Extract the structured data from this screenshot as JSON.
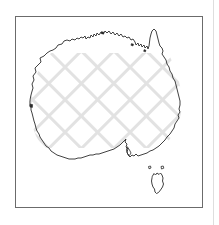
{
  "figure": {
    "title": "Australia",
    "caption": "",
    "frame": {
      "x": 15,
      "y": 16,
      "width": 188,
      "height": 192,
      "border_color": "#6b6b6b",
      "border_width": 1,
      "background_color": "#ffffff"
    },
    "page_background_color": "#ffffff",
    "page_edge_rule": {
      "x": 213,
      "color": "#dedede",
      "width": 1
    }
  },
  "map": {
    "region_name": "Australia",
    "outline_color": "#2b2b2b",
    "outline_width": 0.9,
    "fill_color": "#ffffff",
    "hatch": {
      "pattern": "diagonal-crosshatch",
      "color": "#e2e2e2",
      "angle_degrees": 45,
      "spacing": 23,
      "stroke_width": 6,
      "extent": {
        "x1": 29,
        "y1": 54,
        "x2": 182,
        "y2": 147
      }
    },
    "landmasses": [
      {
        "name": "mainland-australia"
      },
      {
        "name": "tasmania"
      },
      {
        "name": "bass-strait-island-west"
      },
      {
        "name": "bass-strait-island-east"
      }
    ]
  }
}
